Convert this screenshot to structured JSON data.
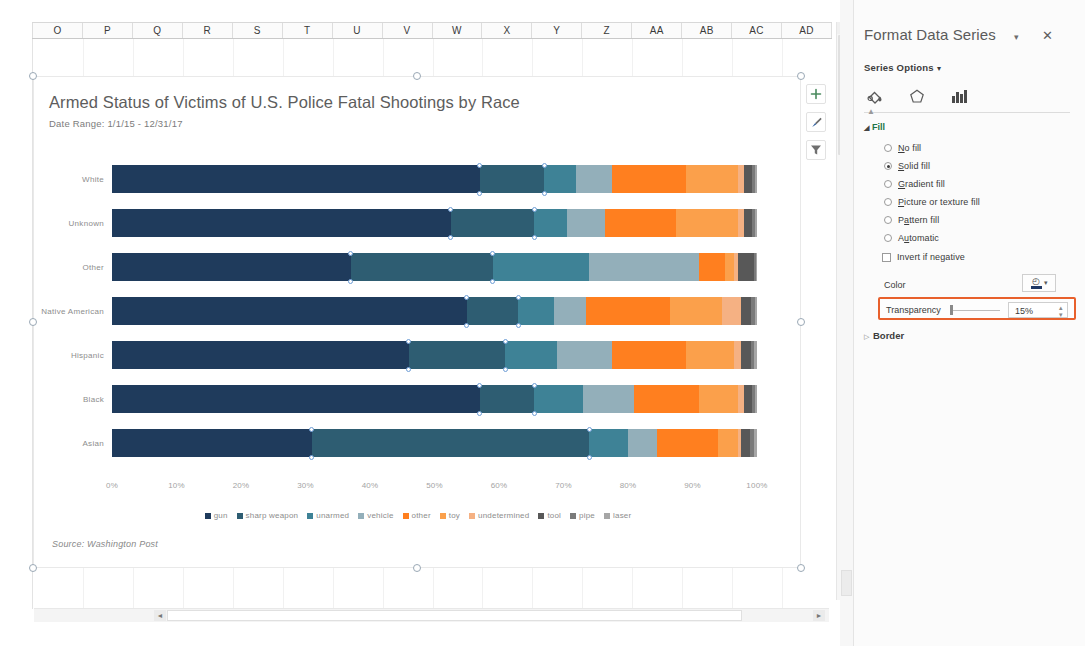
{
  "spreadsheet": {
    "columns": [
      "O",
      "P",
      "Q",
      "R",
      "S",
      "T",
      "U",
      "V",
      "W",
      "X",
      "Y",
      "Z",
      "AA",
      "AB",
      "AC",
      "AD"
    ],
    "v_scroll_up_arrow": "▲",
    "h_scroll_left_arrow": "◄",
    "h_scroll_right_arrow": "►"
  },
  "chart": {
    "title": "Armed Status of Victims of U.S. Police Fatal Shootings by Race",
    "subtitle": "Date Range: 1/1/15 - 12/31/17",
    "source": "Source: Washington Post",
    "buttons": [
      {
        "name": "chart-elements-button",
        "glyph": "+"
      },
      {
        "name": "chart-styles-button",
        "glyph": "brush"
      },
      {
        "name": "chart-filters-button",
        "glyph": "funnel"
      }
    ]
  },
  "chart_data": {
    "type": "bar",
    "orientation": "horizontal",
    "stacked": "100%",
    "title": "Armed Status of Victims of U.S. Police Fatal Shootings by Race",
    "subtitle": "Date Range: 1/1/15 - 12/31/17",
    "source": "Source: Washington Post",
    "xlabel": "",
    "ylabel": "",
    "xlim": [
      0,
      100
    ],
    "xticks": [
      "0%",
      "10%",
      "20%",
      "30%",
      "40%",
      "50%",
      "60%",
      "70%",
      "80%",
      "90%",
      "100%"
    ],
    "grid": false,
    "legend_position": "bottom",
    "categories": [
      "White",
      "Unknown",
      "Other",
      "Native American",
      "Hispanic",
      "Black",
      "Asian"
    ],
    "series": [
      {
        "name": "gun",
        "color": "#1F3B5C",
        "values": [
          57.0,
          52.5,
          37.0,
          55.0,
          46.0,
          57.0,
          31.0
        ]
      },
      {
        "name": "sharp weapon",
        "color": "#2E5D72",
        "values": [
          10.0,
          13.0,
          22.0,
          8.0,
          15.0,
          8.5,
          43.0
        ]
      },
      {
        "name": "unarmed",
        "color": "#3E8296",
        "values": [
          5.0,
          5.0,
          15.0,
          5.5,
          8.0,
          7.5,
          6.0
        ]
      },
      {
        "name": "vehicle",
        "color": "#93AFBA",
        "values": [
          5.5,
          6.0,
          17.0,
          5.0,
          8.5,
          8.0,
          4.5
        ]
      },
      {
        "name": "other",
        "color": "#FF7F1F",
        "values": [
          11.5,
          11.0,
          4.0,
          13.0,
          11.5,
          10.0,
          9.5
        ]
      },
      {
        "name": "toy",
        "color": "#FBA04B",
        "values": [
          8.0,
          9.5,
          1.5,
          8.0,
          7.5,
          6.0,
          3.0
        ]
      },
      {
        "name": "undetermined",
        "color": "#F5B183",
        "values": [
          1.0,
          1.0,
          0.5,
          3.0,
          1.0,
          1.0,
          0.5
        ]
      },
      {
        "name": "tool",
        "color": "#585858",
        "values": [
          1.2,
          1.2,
          2.5,
          1.5,
          1.5,
          1.2,
          1.5
        ]
      },
      {
        "name": "pipe",
        "color": "#7A7A7A",
        "values": [
          0.5,
          0.5,
          0.3,
          0.7,
          0.6,
          0.5,
          0.6
        ]
      },
      {
        "name": "laser",
        "color": "#A6A6A6",
        "values": [
          0.3,
          0.3,
          0.2,
          0.3,
          0.4,
          0.3,
          0.4
        ]
      }
    ]
  },
  "format_pane": {
    "title": "Format Data Series",
    "dropdown_caret": "▾",
    "close_glyph": "✕",
    "series_options_label": "Series Options",
    "series_options_caret": "▾",
    "tabs": [
      {
        "name": "fill-line-tab",
        "label": "Fill & Line"
      },
      {
        "name": "effects-tab",
        "label": "Effects"
      },
      {
        "name": "series-options-tab",
        "label": "Series Options"
      }
    ],
    "fill_section": {
      "header": "Fill",
      "collapse_triangle": "◢",
      "options": [
        {
          "label": "No fill",
          "underline": "N",
          "selected": false
        },
        {
          "label": "Solid fill",
          "underline": "S",
          "selected": true
        },
        {
          "label": "Gradient fill",
          "underline": "G",
          "selected": false
        },
        {
          "label": "Picture or texture fill",
          "underline": "P",
          "selected": false
        },
        {
          "label": "Pattern fill",
          "underline": "a",
          "selected": false
        },
        {
          "label": "Automatic",
          "underline": "u",
          "selected": false
        }
      ],
      "invert_if_negative": {
        "label": "Invert if negative",
        "checked": false
      },
      "color_label": "Color",
      "color_caret": "▾",
      "color_value": "#1F3864",
      "transparency_label": "Transparency",
      "transparency_value": "15%",
      "transparency_spinner": "⁞",
      "highlight_color": "#E8602C"
    },
    "border_section": {
      "header": "Border",
      "expand_triangle": "▷"
    }
  }
}
